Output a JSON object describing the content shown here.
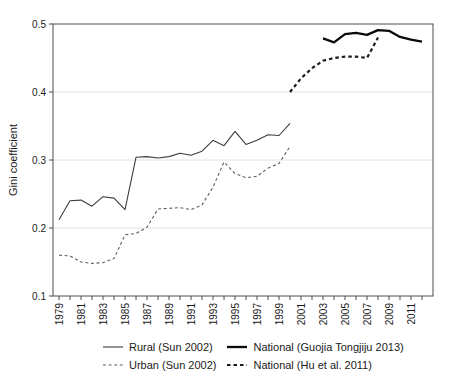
{
  "figure": {
    "title": "",
    "y_axis_label": "Gini coefficient"
  },
  "chart_data": {
    "type": "line",
    "title": "",
    "xlabel": "",
    "ylabel": "Gini coefficient",
    "ylim": [
      0.1,
      0.5
    ],
    "xlim": [
      1978.45,
      2013.0
    ],
    "y_ticks": [
      0.1,
      0.2,
      0.3,
      0.4,
      0.5
    ],
    "x_tick_years": {
      "from": 1979,
      "to": 2012
    },
    "x_tick_labels": [
      1979,
      1981,
      1983,
      1985,
      1987,
      1989,
      1991,
      1993,
      1995,
      1997,
      1999,
      2001,
      2003,
      2005,
      2007,
      2009,
      2011
    ],
    "grid": "horizontal-only",
    "legend_position": "bottom",
    "colors": {
      "frame": "#4d4d4d",
      "grid": "#e2e2e2",
      "tick": "#4d4d4d",
      "text": "#1a1a1a"
    },
    "series": [
      {
        "key": "rural",
        "name": "Rural (Sun 2002)",
        "line_style": "thin-solid",
        "color": "#3d3d3d",
        "width": 1.1,
        "dash": "",
        "x": [
          1979,
          1980,
          1981,
          1982,
          1983,
          1984,
          1985,
          1986,
          1987,
          1988,
          1989,
          1990,
          1991,
          1992,
          1993,
          1994,
          1995,
          1996,
          1997,
          1998,
          1999,
          2000
        ],
        "values": [
          0.212,
          0.24,
          0.241,
          0.232,
          0.246,
          0.244,
          0.227,
          0.304,
          0.305,
          0.303,
          0.305,
          0.31,
          0.307,
          0.313,
          0.329,
          0.321,
          0.342,
          0.323,
          0.329,
          0.337,
          0.336,
          0.354
        ]
      },
      {
        "key": "urban",
        "name": "Urban (Sun 2002)",
        "line_style": "thin-dashed",
        "color": "#5f5f5f",
        "width": 1.1,
        "dash": "3,2.6",
        "x": [
          1979,
          1980,
          1981,
          1982,
          1983,
          1984,
          1985,
          1986,
          1987,
          1988,
          1989,
          1990,
          1991,
          1992,
          1993,
          1994,
          1995,
          1996,
          1997,
          1998,
          1999,
          2000
        ],
        "values": [
          0.16,
          0.159,
          0.15,
          0.148,
          0.149,
          0.155,
          0.19,
          0.192,
          0.201,
          0.228,
          0.229,
          0.23,
          0.227,
          0.234,
          0.26,
          0.297,
          0.28,
          0.274,
          0.276,
          0.288,
          0.295,
          0.32
        ]
      },
      {
        "key": "national_nbs",
        "name": "National (Guojia Tongjiju 2013)",
        "line_style": "thick-solid",
        "color": "#0a0a0a",
        "width": 2.3,
        "dash": "",
        "x": [
          2003,
          2004,
          2005,
          2006,
          2007,
          2008,
          2009,
          2010,
          2011,
          2012
        ],
        "values": [
          0.479,
          0.473,
          0.485,
          0.487,
          0.484,
          0.491,
          0.49,
          0.481,
          0.477,
          0.474
        ]
      },
      {
        "key": "national_hu",
        "name": "National (Hu et al. 2011)",
        "line_style": "thick-dashed",
        "color": "#1c1c1c",
        "width": 2.2,
        "dash": "3.5,3",
        "x": [
          2000,
          2001,
          2002,
          2003,
          2004,
          2005,
          2006,
          2007,
          2008
        ],
        "values": [
          0.4,
          0.42,
          0.435,
          0.446,
          0.45,
          0.452,
          0.452,
          0.45,
          0.48
        ]
      }
    ]
  },
  "legend": {
    "items": [
      {
        "label": "Rural (Sun 2002)",
        "series": "rural"
      },
      {
        "label": "National (Guojia Tongjiju 2013)",
        "series": "national_nbs"
      },
      {
        "label": "Urban (Sun 2002)",
        "series": "urban"
      },
      {
        "label": "National (Hu et al. 2011)",
        "series": "national_hu"
      }
    ]
  }
}
